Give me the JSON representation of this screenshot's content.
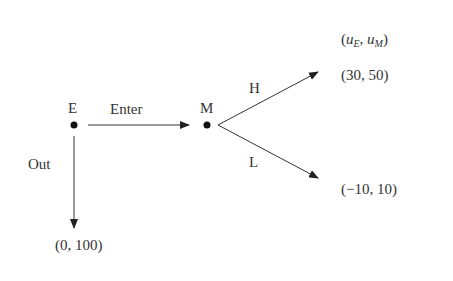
{
  "diagram": {
    "type": "extensive-form game tree",
    "payoff_header": {
      "open": "(",
      "u1": "u",
      "s1": "E",
      "sep": ", ",
      "u2": "u",
      "s2": "M",
      "close": ")"
    },
    "nodes": [
      {
        "id": "E",
        "label": "E",
        "x": 74,
        "y": 125
      },
      {
        "id": "M",
        "label": "M",
        "x": 207,
        "y": 125
      }
    ],
    "edges": [
      {
        "from": "E",
        "to": "M",
        "label": "Enter"
      },
      {
        "from": "E",
        "to": "terminal-out",
        "label": "Out"
      },
      {
        "from": "M",
        "to": "terminal-high",
        "label": "H"
      },
      {
        "from": "M",
        "to": "terminal-low",
        "label": "L"
      }
    ],
    "payoffs": {
      "out": "(0, 100)",
      "high": "(30, 50)",
      "low": "(−10, 10)"
    },
    "colors": {
      "line": "#333333",
      "node": "#111111",
      "text": "#333333"
    }
  }
}
